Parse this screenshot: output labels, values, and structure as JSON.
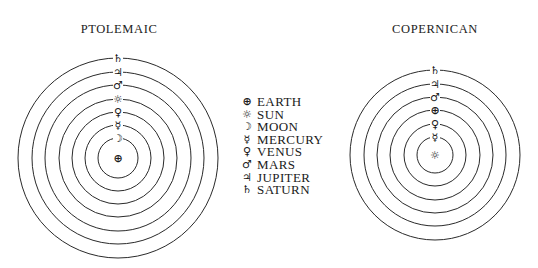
{
  "colors": {
    "background": "#ffffff",
    "line": "#2a2a2a",
    "text": "#1a1a1a"
  },
  "bodies": {
    "earth": {
      "name": "EARTH",
      "symbol": "⊕",
      "icon": "earth-icon"
    },
    "sun": {
      "name": "SUN",
      "symbol": "☼",
      "icon": "sun-icon"
    },
    "moon": {
      "name": "MOON",
      "symbol": "☽",
      "icon": "moon-icon"
    },
    "mercury": {
      "name": "MERCURY",
      "symbol": "☿",
      "icon": "mercury-icon"
    },
    "venus": {
      "name": "VENUS",
      "symbol": "♀",
      "icon": "venus-icon"
    },
    "mars": {
      "name": "MARS",
      "symbol": "♂",
      "icon": "mars-icon"
    },
    "jupiter": {
      "name": "JUPITER",
      "symbol": "♃",
      "icon": "jupiter-icon"
    },
    "saturn": {
      "name": "SATURN",
      "symbol": "♄",
      "icon": "saturn-icon"
    }
  },
  "legend": {
    "items": [
      {
        "key": "earth",
        "symbol": "⊕",
        "label": "EARTH"
      },
      {
        "key": "sun",
        "symbol": "☼",
        "label": "SUN"
      },
      {
        "key": "moon",
        "symbol": "☽",
        "label": "MOON"
      },
      {
        "key": "mercury",
        "symbol": "☿",
        "label": "MERCURY"
      },
      {
        "key": "venus",
        "symbol": "♀",
        "label": "VENUS"
      },
      {
        "key": "mars",
        "symbol": "♂",
        "label": "MARS"
      },
      {
        "key": "jupiter",
        "symbol": "♃",
        "label": "JUPITER"
      },
      {
        "key": "saturn",
        "symbol": "♄",
        "label": "SATURN"
      }
    ]
  },
  "models": [
    {
      "id": "ptolemaic",
      "title": "PTOLEMAIC",
      "title_x": 119,
      "title_y": 22,
      "center": {
        "x": 118,
        "y": 158,
        "key": "earth"
      },
      "orbits": [
        {
          "radius": 20,
          "key": "moon"
        },
        {
          "radius": 33,
          "key": "mercury"
        },
        {
          "radius": 46,
          "key": "venus"
        },
        {
          "radius": 59,
          "key": "sun"
        },
        {
          "radius": 73,
          "key": "mars"
        },
        {
          "radius": 86,
          "key": "jupiter"
        },
        {
          "radius": 100,
          "key": "saturn"
        }
      ]
    },
    {
      "id": "copernican",
      "title": "COPERNICAN",
      "title_x": 435,
      "title_y": 22,
      "center": {
        "x": 435,
        "y": 155,
        "key": "sun"
      },
      "orbits": [
        {
          "radius": 18,
          "key": "mercury"
        },
        {
          "radius": 31,
          "key": "venus"
        },
        {
          "radius": 45,
          "key": "earth"
        },
        {
          "radius": 58,
          "key": "mars"
        },
        {
          "radius": 71,
          "key": "jupiter"
        },
        {
          "radius": 85,
          "key": "saturn"
        }
      ]
    }
  ]
}
